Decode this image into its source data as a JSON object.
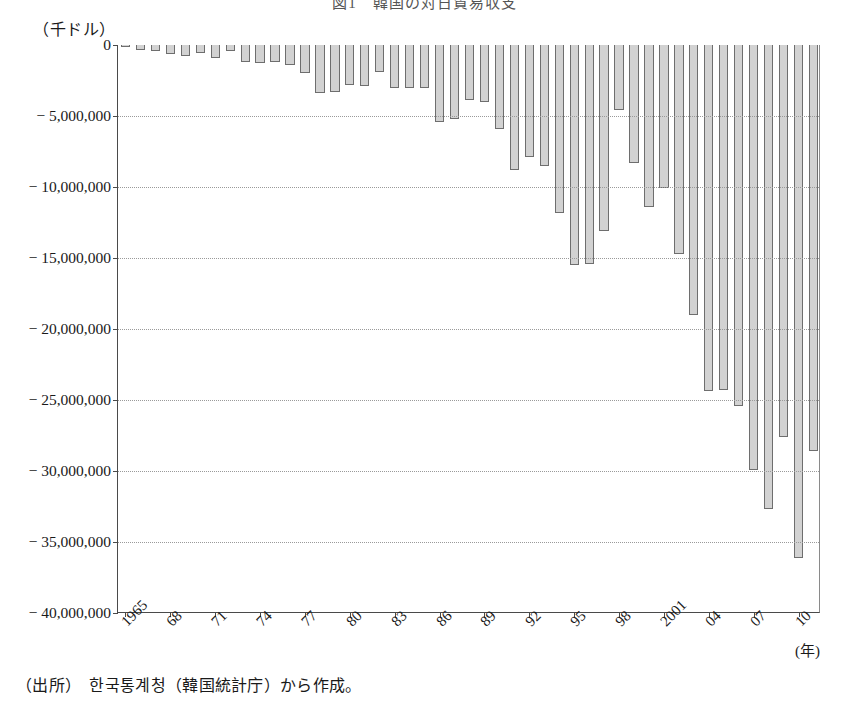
{
  "header": {
    "title_fragment": "図1　韓国の対日貿易収支"
  },
  "axis": {
    "unit_label": "（千ドル）",
    "x_unit_label": "(年)"
  },
  "source": {
    "note": "（出所）　한국통계청（韓国統計庁）から作成。"
  },
  "chart_data": {
    "type": "bar",
    "title": "図1　韓国の対日貿易収支",
    "xlabel": "(年)",
    "ylabel": "（千ドル）",
    "ylim": [
      -40000000,
      0
    ],
    "ytick_labels": [
      "0",
      "− 5,000,000",
      "− 10,000,000",
      "− 15,000,000",
      "− 20,000,000",
      "− 25,000,000",
      "− 30,000,000",
      "− 35,000,000",
      "− 40,000,000"
    ],
    "ytick_values": [
      0,
      -5000000,
      -10000000,
      -15000000,
      -20000000,
      -25000000,
      -30000000,
      -35000000,
      -40000000
    ],
    "xtick_labels": [
      "1965",
      "68",
      "71",
      "74",
      "77",
      "80",
      "83",
      "86",
      "89",
      "92",
      "95",
      "98",
      "2001",
      "04",
      "07",
      "10"
    ],
    "xtick_years": [
      1965,
      1968,
      1971,
      1974,
      1977,
      1980,
      1983,
      1986,
      1989,
      1992,
      1995,
      1998,
      2001,
      2004,
      2007,
      2010
    ],
    "grid": true,
    "legend": "none",
    "bar_color": "#d2d2d2",
    "bar_border_color": "#6e6e6e",
    "categories": [
      1965,
      1966,
      1967,
      1968,
      1969,
      1970,
      1971,
      1972,
      1973,
      1974,
      1975,
      1976,
      1977,
      1978,
      1979,
      1980,
      1981,
      1982,
      1983,
      1984,
      1985,
      1986,
      1987,
      1988,
      1989,
      1990,
      1991,
      1992,
      1993,
      1994,
      1995,
      1996,
      1997,
      1998,
      1999,
      2000,
      2001,
      2002,
      2003,
      2004,
      2005,
      2006,
      2007,
      2008,
      2009,
      2010,
      2011
    ],
    "values": [
      -130000,
      -340000,
      -450000,
      -650000,
      -750000,
      -570000,
      -900000,
      -400000,
      -1200000,
      -1300000,
      -1200000,
      -1400000,
      -2000000,
      -3400000,
      -3300000,
      -2800000,
      -2900000,
      -1900000,
      -3000000,
      -3000000,
      -3000000,
      -5400000,
      -5200000,
      -3900000,
      -4000000,
      -5900000,
      -8800000,
      -7900000,
      -8500000,
      -11800000,
      -15500000,
      -15400000,
      -13100000,
      -4600000,
      -8300000,
      -11400000,
      -10100000,
      -14700000,
      -19000000,
      -24400000,
      -24300000,
      -25400000,
      -29900000,
      -32700000,
      -27600000,
      -36100000,
      -28600000
    ]
  }
}
